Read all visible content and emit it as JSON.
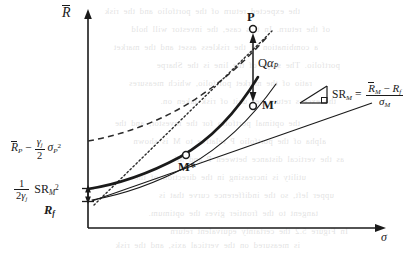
{
  "figure": {
    "type": "finance-diagram",
    "axes": {
      "y_label": "R̄",
      "y_label_plain": "R-bar",
      "x_label": "σ",
      "x_label_plain": "sigma"
    },
    "y_tick_labels": [
      {
        "id": "rp-gamma",
        "text": "R̄P − (γj/2)σP²"
      },
      {
        "id": "half-gamma-sr2",
        "text": "(1/2γj) SRM²"
      },
      {
        "id": "rf",
        "text": "Rf"
      }
    ],
    "points": [
      {
        "id": "P",
        "label": "P"
      },
      {
        "id": "Mp",
        "label": "M'"
      },
      {
        "id": "Ms",
        "label": "M*"
      }
    ],
    "annotations": [
      {
        "id": "q-alpha-p",
        "text": "QαP"
      },
      {
        "id": "sharpe-ratio",
        "text": "SRM = (R̄M − Rf) / σM"
      }
    ],
    "curves": [
      {
        "id": "efficient-frontier",
        "style": "solid-thick"
      },
      {
        "id": "capital-market-line",
        "style": "solid-thin"
      },
      {
        "id": "indifference-curve",
        "style": "dashed"
      },
      {
        "id": "tangent-ray-to-P",
        "style": "dotted"
      },
      {
        "id": "secondary-frontier",
        "style": "solid-thin-curve"
      }
    ],
    "colors": {
      "ink": "#1a1a1a",
      "paper": "#ffffff",
      "bleed_text": "#565656"
    }
  },
  "bleed_text": {
    "lines": [
      "the expected return of the portfolio and the risk",
      "of the return. In this case, the investor will hold",
      "a combination of the riskless asset and the market",
      "portfolio. The slope of the line is the Sharpe",
      "ratio of the market portfolio, which measures",
      "the excess return per unit of risk taken on.",
      "the optimal portfolio for the investor, and the",
      "alpha of the portfolio P relative to M is shown",
      "as the vertical distance between P and M'.",
      "utility is increasing in the direction of the",
      "upper left, so the indifference curve that is",
      "tangent to the frontier gives the optimum.",
      "In Figure 5.2 the certainty equivalent return",
      "is measured on the vertical axis, and the risk",
      "is measured along the horizontal axis below."
    ]
  }
}
